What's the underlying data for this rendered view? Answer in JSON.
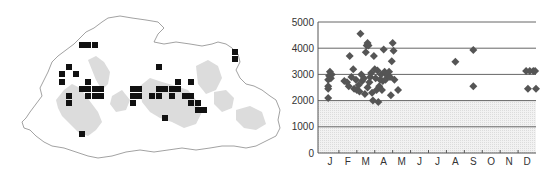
{
  "map": {
    "title": "",
    "marker_color": "#111111",
    "outline_color": "#8a8a8a",
    "relief_color": "#d2d2d2",
    "markers": [
      [
        82,
        45
      ],
      [
        88,
        45
      ],
      [
        95,
        45
      ],
      [
        69,
        67
      ],
      [
        62,
        74
      ],
      [
        76,
        74
      ],
      [
        62,
        82
      ],
      [
        88,
        82
      ],
      [
        82,
        89
      ],
      [
        88,
        89
      ],
      [
        95,
        89
      ],
      [
        101,
        89
      ],
      [
        69,
        96
      ],
      [
        88,
        96
      ],
      [
        95,
        96
      ],
      [
        101,
        96
      ],
      [
        69,
        103
      ],
      [
        82,
        134
      ],
      [
        133,
        89
      ],
      [
        139,
        89
      ],
      [
        133,
        96
      ],
      [
        139,
        96
      ],
      [
        133,
        103
      ],
      [
        159,
        67
      ],
      [
        178,
        82
      ],
      [
        191,
        82
      ],
      [
        159,
        89
      ],
      [
        165,
        89
      ],
      [
        172,
        89
      ],
      [
        178,
        89
      ],
      [
        152,
        96
      ],
      [
        159,
        96
      ],
      [
        172,
        96
      ],
      [
        185,
        96
      ],
      [
        191,
        96
      ],
      [
        191,
        103
      ],
      [
        198,
        103
      ],
      [
        198,
        110
      ],
      [
        204,
        110
      ],
      [
        165,
        118
      ],
      [
        235,
        52
      ],
      [
        235,
        59
      ]
    ]
  },
  "chart_data": {
    "type": "scatter",
    "title": "",
    "xlabel": "",
    "ylabel": "",
    "categories": [
      "J",
      "F",
      "M",
      "A",
      "M",
      "J",
      "J",
      "A",
      "S",
      "O",
      "N",
      "D"
    ],
    "ylim": [
      0,
      5000
    ],
    "yticks": [
      0,
      1000,
      2000,
      3000,
      4000,
      5000
    ],
    "grid": true,
    "shaded_below": 2000,
    "marker": "diamond",
    "marker_color": "#555555",
    "series": [
      {
        "name": "records",
        "points": [
          [
            0.4,
            2100
          ],
          [
            0.4,
            2450
          ],
          [
            0.4,
            2550
          ],
          [
            0.4,
            2800
          ],
          [
            0.45,
            2950
          ],
          [
            0.5,
            3100
          ],
          [
            0.6,
            3000
          ],
          [
            0.55,
            2850
          ],
          [
            1.3,
            2750
          ],
          [
            1.45,
            2700
          ],
          [
            1.55,
            2550
          ],
          [
            1.6,
            3700
          ],
          [
            1.7,
            2900
          ],
          [
            1.8,
            3200
          ],
          [
            1.85,
            2450
          ],
          [
            1.95,
            2800
          ],
          [
            2.0,
            2400
          ],
          [
            2.1,
            2600
          ],
          [
            2.15,
            2350
          ],
          [
            2.2,
            4550
          ],
          [
            2.25,
            3000
          ],
          [
            2.3,
            2750
          ],
          [
            2.4,
            2850
          ],
          [
            2.45,
            2250
          ],
          [
            2.5,
            3850
          ],
          [
            2.55,
            4100
          ],
          [
            2.6,
            4200
          ],
          [
            2.65,
            4100
          ],
          [
            2.6,
            2500
          ],
          [
            2.7,
            2700
          ],
          [
            2.75,
            2900
          ],
          [
            2.8,
            3050
          ],
          [
            2.85,
            2300
          ],
          [
            2.9,
            2000
          ],
          [
            2.95,
            3700
          ],
          [
            3.0,
            3200
          ],
          [
            3.05,
            2850
          ],
          [
            3.1,
            2400
          ],
          [
            3.15,
            3150
          ],
          [
            3.2,
            1950
          ],
          [
            3.25,
            2550
          ],
          [
            3.3,
            2800
          ],
          [
            3.35,
            3000
          ],
          [
            3.4,
            2400
          ],
          [
            3.45,
            2750
          ],
          [
            3.5,
            3950
          ],
          [
            3.55,
            3100
          ],
          [
            3.6,
            2800
          ],
          [
            3.7,
            2950
          ],
          [
            3.8,
            3100
          ],
          [
            3.85,
            2900
          ],
          [
            3.9,
            2200
          ],
          [
            3.95,
            3500
          ],
          [
            4.0,
            4200
          ],
          [
            4.05,
            3900
          ],
          [
            4.1,
            2800
          ],
          [
            4.3,
            2400
          ],
          [
            7.5,
            3480
          ],
          [
            8.5,
            3930
          ],
          [
            8.5,
            2550
          ],
          [
            11.45,
            3130
          ],
          [
            11.55,
            2450
          ],
          [
            11.65,
            3130
          ],
          [
            11.85,
            3130
          ],
          [
            11.95,
            3130
          ],
          [
            12.0,
            2450
          ]
        ]
      }
    ]
  }
}
